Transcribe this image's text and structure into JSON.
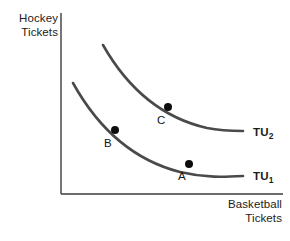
{
  "figure": {
    "kind": "indifference-curve-diagram",
    "background_color": "#ffffff",
    "axis_color": "#3d3d3d",
    "curve_color": "#4a4a4a",
    "point_color": "#0d0d0d",
    "text_color": "#1c1c1c"
  },
  "axes": {
    "y_title": "Hockey\nTickets",
    "x_title": "Basketball\nTickets",
    "origin": {
      "x": 61,
      "y": 194
    },
    "y_top": 13,
    "x_right": 283
  },
  "curves": [
    {
      "id": "TU1",
      "label_text": "TU",
      "label_subscript": "1",
      "label_x": 253,
      "label_y": 170,
      "path": "M 73,83 C 98,128 133,160 180,172 C 205,178 224,177 243,176",
      "points": [
        {
          "name": "B",
          "x": 115,
          "y": 130,
          "label_x": 104,
          "label_y": 137
        },
        {
          "name": "A",
          "x": 189,
          "y": 164,
          "label_x": 178,
          "label_y": 170
        }
      ]
    },
    {
      "id": "TU2",
      "label_text": "TU",
      "label_subscript": "2",
      "label_x": 253,
      "label_y": 126,
      "path": "M 103,45 C 128,89 163,118 207,128 C 222,131 233,131 243,131",
      "points": [
        {
          "name": "C",
          "x": 168,
          "y": 107,
          "label_x": 157,
          "label_y": 114
        }
      ]
    }
  ],
  "point_labels": {
    "a": "A",
    "b": "B",
    "c": "C"
  },
  "chart_data": {
    "type": "line",
    "title": "",
    "xlabel": "Basketball Tickets",
    "ylabel": "Hockey Tickets",
    "grid": false,
    "legend": "inline-right-of-curve",
    "series": [
      {
        "name": "TU1",
        "description": "lower total-utility (indifference) curve, convex to origin",
        "annotations": [
          {
            "label": "B",
            "note": "point on TU1, low basketball / high hockey"
          },
          {
            "label": "A",
            "note": "point on TU1, high basketball / low hockey"
          }
        ]
      },
      {
        "name": "TU2",
        "description": "higher total-utility (indifference) curve, convex to origin, lies above and to the right of TU1",
        "annotations": [
          {
            "label": "C",
            "note": "point on TU2, between B and A in basketball quantity"
          }
        ]
      }
    ]
  }
}
